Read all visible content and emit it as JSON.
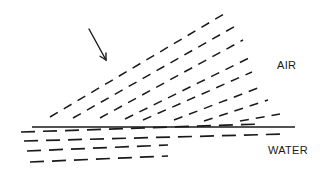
{
  "diagram": {
    "labels": {
      "air": "AIR",
      "water": "WATER"
    },
    "colors": {
      "ink": "#1a1a1a",
      "background": "#ffffff"
    },
    "arrow": {
      "x1": 89,
      "y1": 29,
      "x2": 106,
      "y2": 60
    },
    "surface": {
      "x1": 32,
      "y1": 127,
      "x2": 295,
      "y2": 127
    },
    "air_wavefronts": [
      {
        "x1": 50,
        "y1": 117,
        "x2": 224,
        "y2": 14
      },
      {
        "x1": 73,
        "y1": 118,
        "x2": 239,
        "y2": 24
      },
      {
        "x1": 100,
        "y1": 118,
        "x2": 243,
        "y2": 40
      },
      {
        "x1": 125,
        "y1": 119,
        "x2": 249,
        "y2": 58
      },
      {
        "x1": 143,
        "y1": 120,
        "x2": 252,
        "y2": 72
      },
      {
        "x1": 174,
        "y1": 120,
        "x2": 258,
        "y2": 88
      },
      {
        "x1": 204,
        "y1": 121,
        "x2": 268,
        "y2": 100
      },
      {
        "x1": 240,
        "y1": 121,
        "x2": 280,
        "y2": 114
      }
    ],
    "water_wavefronts": [
      {
        "x1": 21,
        "y1": 132,
        "x2": 262,
        "y2": 124
      },
      {
        "x1": 24,
        "y1": 141,
        "x2": 285,
        "y2": 134
      },
      {
        "x1": 27,
        "y1": 151,
        "x2": 168,
        "y2": 145
      },
      {
        "x1": 30,
        "y1": 162,
        "x2": 168,
        "y2": 156
      }
    ]
  }
}
